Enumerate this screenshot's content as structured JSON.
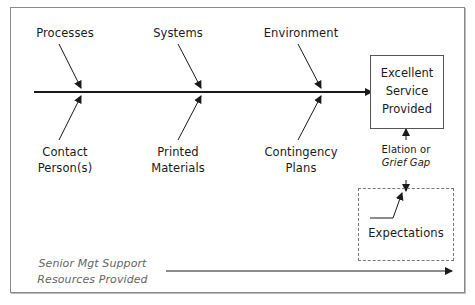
{
  "diagram": {
    "type": "fishbone",
    "top_causes": [
      "Processes",
      "Systems",
      "Environment"
    ],
    "bottom_causes": [
      {
        "line1": "Contact",
        "line2": "Person(s)"
      },
      {
        "line1": "Printed",
        "line2": "Materials"
      },
      {
        "line1": "Contingency",
        "line2": "Plans"
      }
    ],
    "effect": {
      "line1": "Excellent",
      "line2": "Service",
      "line3": "Provided"
    },
    "gap": {
      "line1": "Elation or",
      "line2": "Grief Gap"
    },
    "expectations": "Expectations",
    "foundation": {
      "line1": "Senior Mgt Support",
      "line2": "Resources Provided"
    }
  },
  "colors": {
    "line": "#1a1a1a",
    "frame": "#8a8a8a",
    "muted_text": "#666666"
  }
}
